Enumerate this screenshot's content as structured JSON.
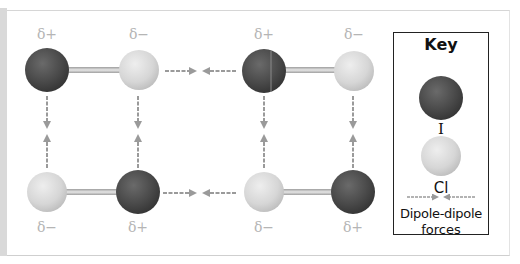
{
  "diagram": {
    "colors": {
      "iodine": "#4a4a4a",
      "chlorine": "#d8d8d8",
      "bond": "#bdbdbd",
      "arrow": "#9a9a9a",
      "delta_text": "#b5b5b5"
    },
    "molecules": [
      {
        "position": "top-left",
        "atoms": [
          "I",
          "Cl"
        ],
        "charges": [
          "δ+",
          "δ−"
        ]
      },
      {
        "position": "top-right",
        "atoms": [
          "I",
          "Cl"
        ],
        "charges": [
          "δ+",
          "δ−"
        ]
      },
      {
        "position": "bottom-left",
        "atoms": [
          "Cl",
          "I"
        ],
        "charges": [
          "δ−",
          "δ+"
        ]
      },
      {
        "position": "bottom-right",
        "atoms": [
          "Cl",
          "I"
        ],
        "charges": [
          "δ−",
          "δ+"
        ]
      }
    ],
    "labels": {
      "tl_left": "δ+",
      "tl_right": "δ−",
      "tr_left": "δ+",
      "tr_right": "δ−",
      "bl_left": "δ−",
      "bl_right": "δ+",
      "br_left": "δ−",
      "br_right": "δ+"
    }
  },
  "key": {
    "title": "Key",
    "iodine_label": "I",
    "chlorine_label": "Cl",
    "force_label_line1": "Dipole-dipole",
    "force_label_line2": "forces"
  }
}
